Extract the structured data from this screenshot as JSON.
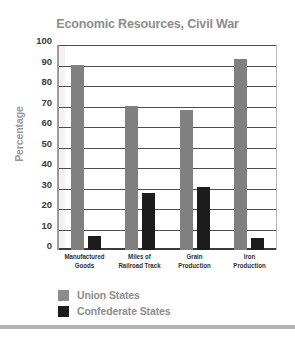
{
  "chart_data": {
    "type": "bar",
    "title": "Economic Resources, Civil War",
    "xlabel": "",
    "ylabel": "Percentage",
    "ylim": [
      0,
      100
    ],
    "ytick_labels": [
      "100",
      "90",
      "80",
      "70",
      "60",
      "50",
      "40",
      "30",
      "20",
      "10",
      "0"
    ],
    "yticks": [
      100,
      90,
      80,
      70,
      60,
      50,
      40,
      30,
      20,
      10,
      0
    ],
    "grid": true,
    "legend_position": "bottom-left",
    "categories": [
      "Manufactured Goods",
      "Miles of Railroad Track",
      "Grain Production",
      "Iron Production"
    ],
    "category_lines": [
      [
        "Manufactured",
        "Goods"
      ],
      [
        "Miles of",
        "Railroad Track"
      ],
      [
        "Grain",
        "Production"
      ],
      [
        "Iron",
        "Production"
      ]
    ],
    "series": [
      {
        "name": "Union States",
        "color": "#808080",
        "values": [
          91,
          71,
          69,
          94
        ]
      },
      {
        "name": "Confederate States",
        "color": "#1c1c1c",
        "values": [
          7,
          28,
          31,
          6
        ]
      }
    ]
  },
  "colors": {
    "union": "#808080",
    "confederate": "#1c1c1c",
    "title_text": "#8d8d8d",
    "axis_text": "#3b3b3b",
    "gridline": "#4d4d4d",
    "legend_text": "#8d8d8d",
    "bottom_rule": "#b4b4b4"
  }
}
